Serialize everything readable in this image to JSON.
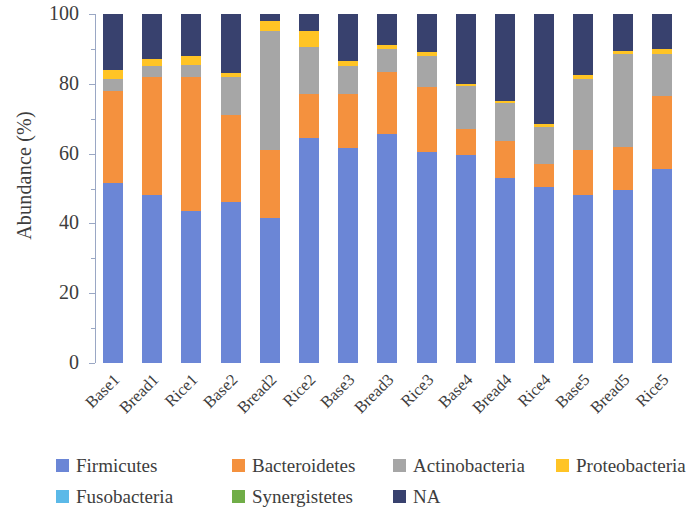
{
  "chart_data": {
    "type": "bar",
    "stacked": true,
    "title": "",
    "xlabel": "",
    "ylabel": "Abundance (%)",
    "ylim": [
      0,
      100
    ],
    "y_ticks": [
      0,
      20,
      40,
      60,
      80,
      100
    ],
    "y_minor_ticks": [
      10,
      30,
      50,
      70,
      90
    ],
    "grid": false,
    "legend_position": "bottom",
    "categories": [
      "Base1",
      "Bread1",
      "Rice1",
      "Base2",
      "Bread2",
      "Rice2",
      "Base3",
      "Bread3",
      "Rice3",
      "Base4",
      "Bread4",
      "Rice4",
      "Base5",
      "Bread5",
      "Rice5"
    ],
    "series": [
      {
        "name": "Firmicutes",
        "color": "#6b86d6",
        "values": [
          51.5,
          48.0,
          43.5,
          46.0,
          41.5,
          64.5,
          61.5,
          65.5,
          60.5,
          59.5,
          53.0,
          50.5,
          48.0,
          49.5,
          55.5
        ]
      },
      {
        "name": "Bacteroidetes",
        "color": "#f4913e",
        "values": [
          26.5,
          34.0,
          38.5,
          25.0,
          19.5,
          12.5,
          15.5,
          18.0,
          18.5,
          7.5,
          10.5,
          6.5,
          13.0,
          12.5,
          21.0
        ]
      },
      {
        "name": "Actinobacteria",
        "color": "#a6a6a6",
        "values": [
          3.5,
          3.0,
          3.5,
          11.0,
          34.0,
          13.5,
          8.0,
          6.5,
          9.0,
          12.5,
          11.0,
          10.5,
          20.5,
          26.5,
          12.0
        ]
      },
      {
        "name": "Proteobacteria",
        "color": "#ffc425",
        "values": [
          2.5,
          2.0,
          2.5,
          1.0,
          3.0,
          4.5,
          1.5,
          1.0,
          1.0,
          0.5,
          0.5,
          1.0,
          1.0,
          1.0,
          1.5
        ]
      },
      {
        "name": "Fusobacteria",
        "color": "#5bb9e8",
        "values": [
          0,
          0,
          0,
          0,
          0,
          0,
          0,
          0,
          0,
          0,
          0,
          0,
          0,
          0,
          0
        ]
      },
      {
        "name": "Synergistetes",
        "color": "#70ad47",
        "values": [
          0,
          0,
          0,
          0,
          0,
          0,
          0,
          0,
          0,
          0,
          0,
          0,
          0,
          0,
          0
        ]
      },
      {
        "name": "NA",
        "color": "#38416e",
        "values": [
          16.0,
          13.0,
          12.0,
          17.0,
          2.0,
          5.0,
          13.5,
          9.0,
          11.0,
          20.0,
          25.0,
          31.5,
          17.5,
          10.5,
          10.0
        ]
      }
    ]
  },
  "axis": {
    "y_title": "Abundance (%)",
    "y_tick_labels": [
      "100",
      "80",
      "60",
      "40",
      "20",
      "0"
    ]
  },
  "legend": {
    "rows": [
      [
        {
          "label": "Firmicutes",
          "color": "#6b86d6"
        },
        {
          "label": "Bacteroidetes",
          "color": "#f4913e"
        },
        {
          "label": "Actinobacteria",
          "color": "#a6a6a6"
        },
        {
          "label": "Proteobacteria",
          "color": "#ffc425"
        }
      ],
      [
        {
          "label": "Fusobacteria",
          "color": "#5bb9e8"
        },
        {
          "label": "Synergistetes",
          "color": "#70ad47"
        },
        {
          "label": "NA",
          "color": "#38416e"
        }
      ]
    ]
  }
}
